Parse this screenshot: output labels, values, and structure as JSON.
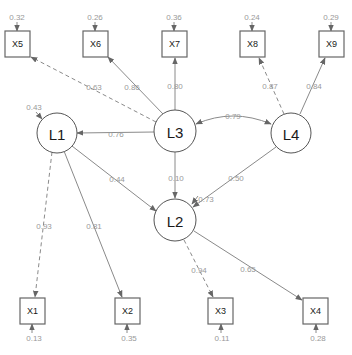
{
  "diagram": {
    "type": "structural-equation-model-path-diagram",
    "latent": [
      {
        "id": "L1",
        "label": "L1",
        "residual": "0.43"
      },
      {
        "id": "L2",
        "label": "L2",
        "residual": "0.73"
      },
      {
        "id": "L3",
        "label": "L3"
      },
      {
        "id": "L4",
        "label": "L4"
      }
    ],
    "observed": [
      {
        "id": "X1",
        "label": "X1",
        "residual": "0.13"
      },
      {
        "id": "X2",
        "label": "X2",
        "residual": "0.35"
      },
      {
        "id": "X3",
        "label": "X3",
        "residual": "0.11"
      },
      {
        "id": "X4",
        "label": "X4",
        "residual": "0.28"
      },
      {
        "id": "X5",
        "label": "X5",
        "residual": "0.32"
      },
      {
        "id": "X6",
        "label": "X6",
        "residual": "0.26"
      },
      {
        "id": "X7",
        "label": "X7",
        "residual": "0.36"
      },
      {
        "id": "X8",
        "label": "X8",
        "residual": "0.24"
      },
      {
        "id": "X9",
        "label": "X9",
        "residual": "0.29"
      }
    ],
    "edges": [
      {
        "from": "L3",
        "to": "X5",
        "label": "0.63",
        "style": "dashed"
      },
      {
        "from": "L3",
        "to": "X6",
        "label": "0.86",
        "style": "solid"
      },
      {
        "from": "L3",
        "to": "X7",
        "label": "0.80",
        "style": "solid"
      },
      {
        "from": "L4",
        "to": "X8",
        "label": "0.87",
        "style": "dashed"
      },
      {
        "from": "L4",
        "to": "X9",
        "label": "0.84",
        "style": "solid"
      },
      {
        "from": "L3",
        "to": "L1",
        "label": "0.76",
        "style": "solid"
      },
      {
        "from": "L3",
        "to": "L4",
        "label": "0.79",
        "style": "solid",
        "bidirectional": true
      },
      {
        "from": "L1",
        "to": "L2",
        "label": "0.44",
        "style": "solid"
      },
      {
        "from": "L3",
        "to": "L2",
        "label": "0.10",
        "style": "solid"
      },
      {
        "from": "L4",
        "to": "L2",
        "label": "0.50",
        "style": "solid"
      },
      {
        "from": "L1",
        "to": "X1",
        "label": "0.93",
        "style": "dashed"
      },
      {
        "from": "L1",
        "to": "X2",
        "label": "0.81",
        "style": "solid"
      },
      {
        "from": "L2",
        "to": "X3",
        "label": "0.94",
        "style": "dashed"
      },
      {
        "from": "L2",
        "to": "X4",
        "label": "0.65",
        "style": "solid"
      }
    ]
  }
}
